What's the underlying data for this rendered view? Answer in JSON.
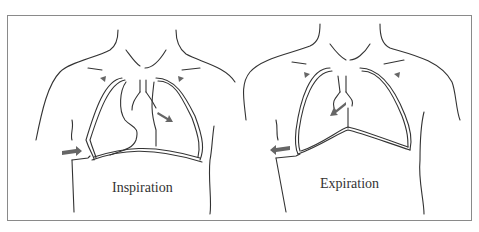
{
  "diagram": {
    "panels": [
      {
        "id": "inspiration",
        "label": "Inspiration"
      },
      {
        "id": "expiration",
        "label": "Expiration"
      }
    ],
    "colors": {
      "line": "#333333",
      "arrow": "#666666",
      "frame": "#8a8a8a"
    }
  }
}
